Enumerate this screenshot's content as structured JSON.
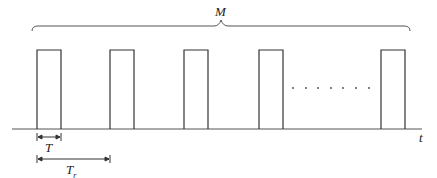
{
  "diagram": {
    "title_label": "M",
    "axis_label": "t",
    "pulse_width_label": "T",
    "period_label_main": "T",
    "period_label_sub": "r",
    "ellipsis": "· · · · · · ·",
    "pulses": [
      {
        "x": 37,
        "w": 24
      },
      {
        "x": 110,
        "w": 24
      },
      {
        "x": 184,
        "w": 24
      },
      {
        "x": 259,
        "w": 24
      },
      {
        "x": 381,
        "w": 24
      }
    ],
    "colors": {
      "line": "#333333"
    }
  }
}
